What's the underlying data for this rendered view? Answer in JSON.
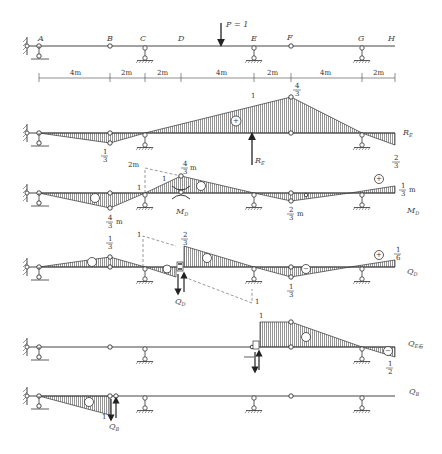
{
  "beam": {
    "points": [
      "A",
      "B",
      "C",
      "D",
      "E",
      "F",
      "G",
      "H"
    ],
    "load_label": "P = 1",
    "spans": [
      "4m",
      "2m",
      "2m",
      "4m",
      "2m",
      "4m",
      "2m"
    ]
  },
  "diagrams": [
    {
      "name": "R_E",
      "label_main": "R",
      "label_sub": "E",
      "values": {
        "at_B": "1/3",
        "at_D_under_load": "1",
        "at_F": "4/3",
        "at_H": "2/3"
      },
      "signs": [
        "+"
      ],
      "arrow_label": "R_E"
    },
    {
      "name": "M_D",
      "label_main": "M",
      "label_sub": "D",
      "values": {
        "at_B": "4/3 m",
        "at_C": "1",
        "at_D": "4/3 m",
        "dashed_top": "2m",
        "slope": "1",
        "at_F": "2/3 m",
        "at_H": "1/3 m"
      },
      "signs": [
        "−",
        "+",
        "−",
        "+"
      ]
    },
    {
      "name": "Q_D",
      "label_main": "Q",
      "label_sub": "D",
      "values": {
        "at_B": "1/3",
        "dashed_top": "1",
        "at_D_right": "2/3",
        "dashed_bottom": "1",
        "at_F": "1/3",
        "at_H": "1/6"
      },
      "signs": [
        "+",
        "−",
        "+",
        "−",
        "+"
      ]
    },
    {
      "name": "Q_E_right",
      "label_main": "Q",
      "label_sub": "E右",
      "values": {
        "at_E": "1",
        "at_H": "1/2"
      },
      "signs": [
        "+",
        "−"
      ]
    },
    {
      "name": "Q_B",
      "label_main": "Q",
      "label_sub": "B",
      "values": {
        "at_B": "1"
      },
      "signs": [
        "−"
      ]
    }
  ],
  "text": {
    "A": "A",
    "B": "B",
    "C": "C",
    "D": "D",
    "E": "E",
    "F": "F",
    "G": "G",
    "H": "H",
    "P": "P = 1",
    "s1": "4m",
    "s2": "2m",
    "s3": "2m",
    "s4": "4m",
    "s5": "2m",
    "s6": "4m",
    "s7": "2m",
    "re_one": "1",
    "re_four": "4",
    "re_three": "3",
    "re_b_num": "1",
    "re_b_den": "3",
    "re_h_num": "2",
    "re_h_den": "3",
    "re_label": "R",
    "re_sub": "E",
    "re_arrow_label": "R",
    "re_arrow_sub": "E",
    "md_2m": "2m",
    "md_one_c": "1",
    "md_one_slope": "1",
    "md_d_num": "4",
    "md_d_den": "3",
    "md_m": "m",
    "md_b_num": "4",
    "md_b_den": "3",
    "md_f_num": "2",
    "md_f_den": "3",
    "md_h_num": "1",
    "md_h_den": "3",
    "md_label": "M",
    "md_sub": "D",
    "md_under": "M",
    "md_under_sub": "D",
    "qd_b_num": "1",
    "qd_b_den": "3",
    "qd_one_top": "1",
    "qd_d_num": "2",
    "qd_d_den": "3",
    "qd_one_bot": "1",
    "qd_f_num": "1",
    "qd_f_den": "3",
    "qd_h_num": "1",
    "qd_h_den": "6",
    "qd_label": "Q",
    "qd_sub": "D",
    "qd_under": "Q",
    "qd_under_sub": "D",
    "qe_one": "1",
    "qe_h_num": "1",
    "qe_h_den": "2",
    "qe_label": "Q",
    "qe_sub": "E右",
    "qb_one": "1",
    "qb_label": "Q",
    "qb_sub": "B",
    "qb_under": "Q",
    "qb_under_sub": "B",
    "plus": "+",
    "minus": "−"
  },
  "colors": {
    "ink": "#333333",
    "hatch": "#555555",
    "background": "#ffffff"
  }
}
